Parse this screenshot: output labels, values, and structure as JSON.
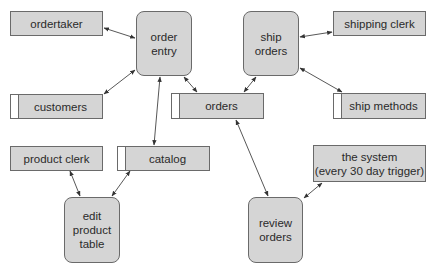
{
  "diagram": {
    "type": "data-flow-diagram",
    "colors": {
      "fill": "#d5d5d5",
      "border": "#6a6a6a",
      "line": "#333333",
      "store_tab": "#ffffff"
    },
    "entities": [
      {
        "id": "ordertaker",
        "label": "ordertaker"
      },
      {
        "id": "shipping_clerk",
        "label": "shipping clerk"
      },
      {
        "id": "product_clerk",
        "label": "product clerk"
      },
      {
        "id": "the_system",
        "label": "the system\n(every 30 day trigger)"
      }
    ],
    "processes": [
      {
        "id": "order_entry",
        "label": "order\nentry"
      },
      {
        "id": "ship_orders",
        "label": "ship\norders"
      },
      {
        "id": "edit_product_table",
        "label": "edit\nproduct\ntable"
      },
      {
        "id": "review_orders",
        "label": "review\norders"
      }
    ],
    "data_stores": [
      {
        "id": "customers",
        "label": "customers"
      },
      {
        "id": "orders",
        "label": "orders"
      },
      {
        "id": "ship_methods",
        "label": "ship methods"
      },
      {
        "id": "catalog",
        "label": "catalog"
      }
    ],
    "flows": [
      {
        "from": "ordertaker",
        "to": "order_entry",
        "bidirectional": true
      },
      {
        "from": "order_entry",
        "to": "customers",
        "bidirectional": true
      },
      {
        "from": "order_entry",
        "to": "orders",
        "bidirectional": true
      },
      {
        "from": "order_entry",
        "to": "catalog",
        "bidirectional": true
      },
      {
        "from": "ship_orders",
        "to": "shipping_clerk",
        "bidirectional": true
      },
      {
        "from": "ship_orders",
        "to": "orders",
        "bidirectional": true
      },
      {
        "from": "ship_orders",
        "to": "ship_methods",
        "bidirectional": true
      },
      {
        "from": "product_clerk",
        "to": "edit_product_table",
        "bidirectional": true
      },
      {
        "from": "catalog",
        "to": "edit_product_table",
        "bidirectional": true
      },
      {
        "from": "orders",
        "to": "review_orders",
        "bidirectional": true
      },
      {
        "from": "the_system",
        "to": "review_orders",
        "bidirectional": true
      }
    ]
  }
}
